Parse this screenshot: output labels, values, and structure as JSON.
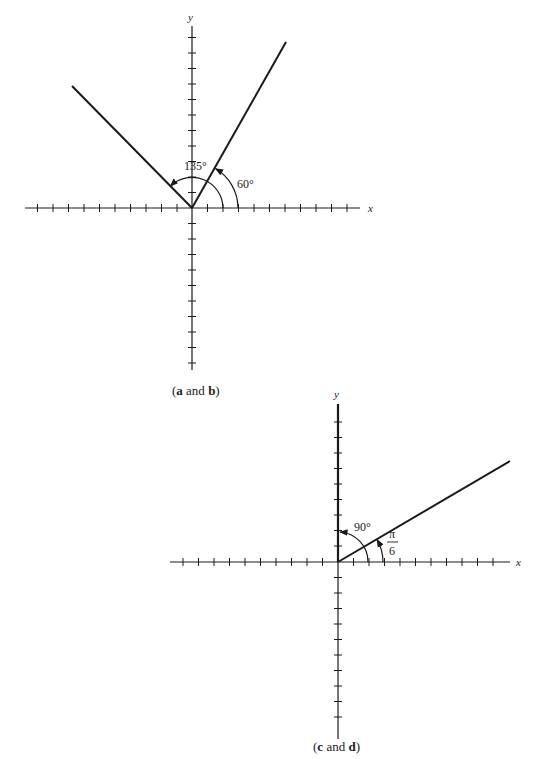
{
  "figures": [
    {
      "id": "a-b",
      "caption": {
        "open": "(",
        "a": "a",
        "and": " and ",
        "b": "b",
        "close": ")"
      },
      "axis_labels": {
        "x": "x",
        "y": "y"
      },
      "angles": [
        {
          "label": "135°",
          "degrees": 135,
          "direction": "counterclockwise"
        },
        {
          "label": "60°",
          "degrees": 60,
          "direction": "counterclockwise"
        }
      ]
    },
    {
      "id": "c-d",
      "caption": {
        "open": "(",
        "c": "c",
        "and": " and ",
        "d": "d",
        "close": ")"
      },
      "axis_labels": {
        "x": "x",
        "y": "y"
      },
      "angles": [
        {
          "label": "90°",
          "degrees": 90,
          "direction": "counterclockwise"
        },
        {
          "label_num": "π",
          "label_den": "6",
          "radians": "π/6",
          "direction": "counterclockwise"
        }
      ]
    }
  ],
  "colors": {
    "ink": "#1a1a1a",
    "background": "#ffffff"
  }
}
